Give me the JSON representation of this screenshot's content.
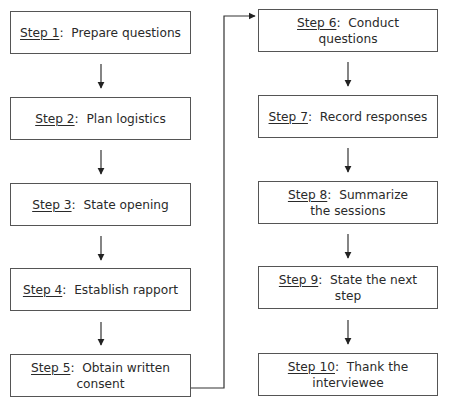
{
  "diagram": {
    "type": "flowchart",
    "columns": 2,
    "steps": [
      {
        "label": "Step 1",
        "text": "Prepare questions"
      },
      {
        "label": "Step 2",
        "text": "Plan logistics"
      },
      {
        "label": "Step 3",
        "text": "State opening"
      },
      {
        "label": "Step 4",
        "text": "Establish rapport"
      },
      {
        "label": "Step 5",
        "text": "Obtain written consent"
      },
      {
        "label": "Step 6",
        "text": "Conduct questions"
      },
      {
        "label": "Step 7",
        "text": "Record responses"
      },
      {
        "label": "Step 8",
        "text": "Summarize the sessions"
      },
      {
        "label": "Step 9",
        "text": "State the next step"
      },
      {
        "label": "Step 10",
        "text": "Thank the interviewee"
      }
    ],
    "separator": ":",
    "colors": {
      "line": "#333333",
      "border": "#555555",
      "text": "#2a2a2a",
      "background": "#ffffff"
    }
  }
}
